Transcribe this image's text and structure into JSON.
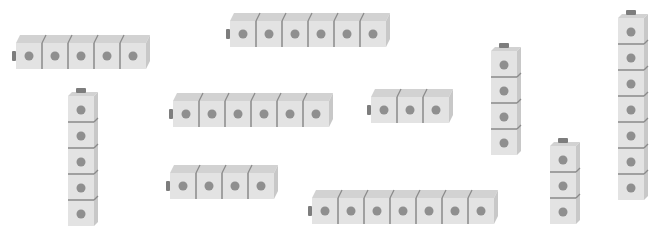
{
  "colors": {
    "front": "#e3e3e3",
    "top": "#d2d2d2",
    "side": "#c8c8c8",
    "divider": "#8a8a8a",
    "dot": "#8f8f8f",
    "knob": "#7d7d7d"
  },
  "cube_size": 26,
  "trains": [
    {
      "id": "train-1",
      "orientation": "horizontal",
      "cubes": 5,
      "x": 16,
      "y": 35
    },
    {
      "id": "train-2",
      "orientation": "horizontal",
      "cubes": 6,
      "x": 230,
      "y": 13
    },
    {
      "id": "train-3",
      "orientation": "vertical",
      "cubes": 5,
      "x": 68,
      "y": 88
    },
    {
      "id": "train-4",
      "orientation": "horizontal",
      "cubes": 6,
      "x": 173,
      "y": 93
    },
    {
      "id": "train-5",
      "orientation": "horizontal",
      "cubes": 3,
      "x": 371,
      "y": 89
    },
    {
      "id": "train-6",
      "orientation": "vertical",
      "cubes": 4,
      "x": 491,
      "y": 43
    },
    {
      "id": "train-7",
      "orientation": "horizontal",
      "cubes": 4,
      "x": 170,
      "y": 165
    },
    {
      "id": "train-8",
      "orientation": "horizontal",
      "cubes": 7,
      "x": 312,
      "y": 190
    },
    {
      "id": "train-9",
      "orientation": "vertical",
      "cubes": 3,
      "x": 550,
      "y": 138
    },
    {
      "id": "train-10",
      "orientation": "vertical",
      "cubes": 7,
      "x": 618,
      "y": 10
    }
  ],
  "total_cubes": 50
}
